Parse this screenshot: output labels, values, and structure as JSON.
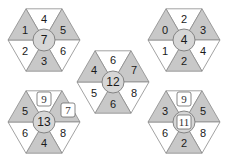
{
  "puzzle": {
    "description": "Hexagon number puzzle: each hexagon split into 6 alternating grey/white triangles around a central circle",
    "colors": {
      "grey": "#c8c8c8",
      "white": "#ffffff",
      "circle": "#d6d6d6",
      "stroke": "#8a8a8a"
    },
    "hexagons": [
      {
        "id": "top-left",
        "center": "7",
        "center_boxed": false,
        "triangles": {
          "top": {
            "value": "4",
            "shade": "white",
            "boxed": false
          },
          "upper_right": {
            "value": "5",
            "shade": "grey",
            "boxed": false
          },
          "lower_right": {
            "value": "6",
            "shade": "white",
            "boxed": false
          },
          "bottom": {
            "value": "3",
            "shade": "grey",
            "boxed": false
          },
          "lower_left": {
            "value": "2",
            "shade": "white",
            "boxed": false
          },
          "upper_left": {
            "value": "1",
            "shade": "grey",
            "boxed": false
          }
        }
      },
      {
        "id": "top-right",
        "center": "4",
        "center_boxed": false,
        "triangles": {
          "top": {
            "value": "2",
            "shade": "white",
            "boxed": false
          },
          "upper_right": {
            "value": "3",
            "shade": "grey",
            "boxed": false
          },
          "lower_right": {
            "value": "4",
            "shade": "white",
            "boxed": false
          },
          "bottom": {
            "value": "2",
            "shade": "grey",
            "boxed": false
          },
          "lower_left": {
            "value": "1",
            "shade": "white",
            "boxed": false
          },
          "upper_left": {
            "value": "0",
            "shade": "grey",
            "boxed": false
          }
        }
      },
      {
        "id": "middle",
        "center": "12",
        "center_boxed": false,
        "triangles": {
          "top": {
            "value": "6",
            "shade": "white",
            "boxed": false
          },
          "upper_right": {
            "value": "7",
            "shade": "grey",
            "boxed": false
          },
          "lower_right": {
            "value": "8",
            "shade": "white",
            "boxed": false
          },
          "bottom": {
            "value": "6",
            "shade": "grey",
            "boxed": false
          },
          "lower_left": {
            "value": "5",
            "shade": "white",
            "boxed": false
          },
          "upper_left": {
            "value": "4",
            "shade": "grey",
            "boxed": false
          }
        }
      },
      {
        "id": "bottom-left",
        "center": "13",
        "center_boxed": false,
        "triangles": {
          "top": {
            "value": "9",
            "shade": "white",
            "boxed": true
          },
          "upper_right": {
            "value": "7",
            "shade": "grey",
            "boxed": true
          },
          "lower_right": {
            "value": "8",
            "shade": "white",
            "boxed": false
          },
          "bottom": {
            "value": "4",
            "shade": "grey",
            "boxed": false
          },
          "lower_left": {
            "value": "6",
            "shade": "white",
            "boxed": false
          },
          "upper_left": {
            "value": "5",
            "shade": "grey",
            "boxed": false
          }
        }
      },
      {
        "id": "bottom-right",
        "center": "11",
        "center_boxed": true,
        "triangles": {
          "top": {
            "value": "9",
            "shade": "white",
            "boxed": true
          },
          "upper_right": {
            "value": "5",
            "shade": "grey",
            "boxed": false
          },
          "lower_right": {
            "value": "8",
            "shade": "white",
            "boxed": false
          },
          "bottom": {
            "value": "2",
            "shade": "grey",
            "boxed": false
          },
          "lower_left": {
            "value": "6",
            "shade": "white",
            "boxed": false
          },
          "upper_left": {
            "value": "3",
            "shade": "grey",
            "boxed": false
          }
        }
      }
    ]
  }
}
